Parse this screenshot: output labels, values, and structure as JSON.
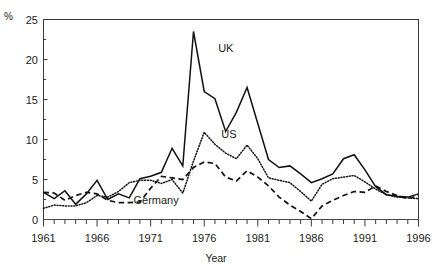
{
  "chart_data": {
    "type": "line",
    "title": "",
    "xlabel": "Year",
    "ylabel": "%",
    "xlim": [
      1961,
      1996
    ],
    "ylim": [
      0,
      25
    ],
    "yticks": [
      0,
      5,
      10,
      15,
      20,
      25
    ],
    "ytick_labels": [
      "0",
      "5",
      "10",
      "15",
      "20",
      "25"
    ],
    "y_minor_tick_step": 2.5,
    "xticks": [
      1961,
      1966,
      1971,
      1976,
      1981,
      1986,
      1991,
      1996
    ],
    "xtick_labels": [
      "1961",
      "1966",
      "1971",
      "1976",
      "1981",
      "1986",
      "1991",
      "1996"
    ],
    "x_minor_tick_step": 1,
    "grid": false,
    "legend_position": "inline-annotations",
    "x": [
      1961,
      1962,
      1963,
      1964,
      1965,
      1966,
      1967,
      1968,
      1969,
      1970,
      1971,
      1972,
      1973,
      1974,
      1975,
      1976,
      1977,
      1978,
      1979,
      1980,
      1981,
      1982,
      1983,
      1984,
      1985,
      1986,
      1987,
      1988,
      1989,
      1990,
      1991,
      1992,
      1993,
      1994,
      1995,
      1996
    ],
    "series": [
      {
        "name": "UK",
        "style": "solid",
        "color": "#111111",
        "values": [
          3.4,
          2.6,
          3.6,
          1.9,
          3.2,
          4.9,
          2.5,
          3.2,
          2.7,
          5.1,
          5.4,
          5.9,
          8.9,
          6.7,
          23.5,
          16.0,
          15.1,
          11.0,
          13.4,
          16.5,
          12.0,
          7.5,
          6.5,
          6.7,
          5.7,
          4.6,
          5.1,
          5.7,
          7.6,
          8.1,
          6.2,
          4.1,
          3.1,
          2.9,
          2.8,
          3.2
        ]
      },
      {
        "name": "US",
        "style": "dotted",
        "color": "#111111",
        "values": [
          1.4,
          1.8,
          1.7,
          1.7,
          2.1,
          3.0,
          2.8,
          3.5,
          4.6,
          4.9,
          4.9,
          4.5,
          5.0,
          3.3,
          7.3,
          10.9,
          9.4,
          8.3,
          7.6,
          9.3,
          7.6,
          5.2,
          4.9,
          4.6,
          3.5,
          2.3,
          4.4,
          5.1,
          5.3,
          5.5,
          4.7,
          3.8,
          3.1,
          2.8,
          2.7,
          2.6
        ]
      },
      {
        "name": "Germany",
        "style": "dashed",
        "color": "#111111",
        "values": [
          3.4,
          3.3,
          2.4,
          3.0,
          3.4,
          3.2,
          2.4,
          2.1,
          2.1,
          2.2,
          3.9,
          5.4,
          5.2,
          5.0,
          6.5,
          7.2,
          7.0,
          5.3,
          4.8,
          6.1,
          5.3,
          4.2,
          2.8,
          1.8,
          1.0,
          0.1,
          1.7,
          2.4,
          3.0,
          3.5,
          3.4,
          4.2,
          3.5,
          3.0,
          2.6,
          3.0
        ]
      }
    ],
    "annotations": [
      {
        "text": "UK",
        "x": 1977.3,
        "y": 21.0
      },
      {
        "text": "US",
        "x": 1977.6,
        "y": 10.2
      },
      {
        "text": "Germany",
        "x": 1969.4,
        "y": 1.9
      }
    ]
  }
}
